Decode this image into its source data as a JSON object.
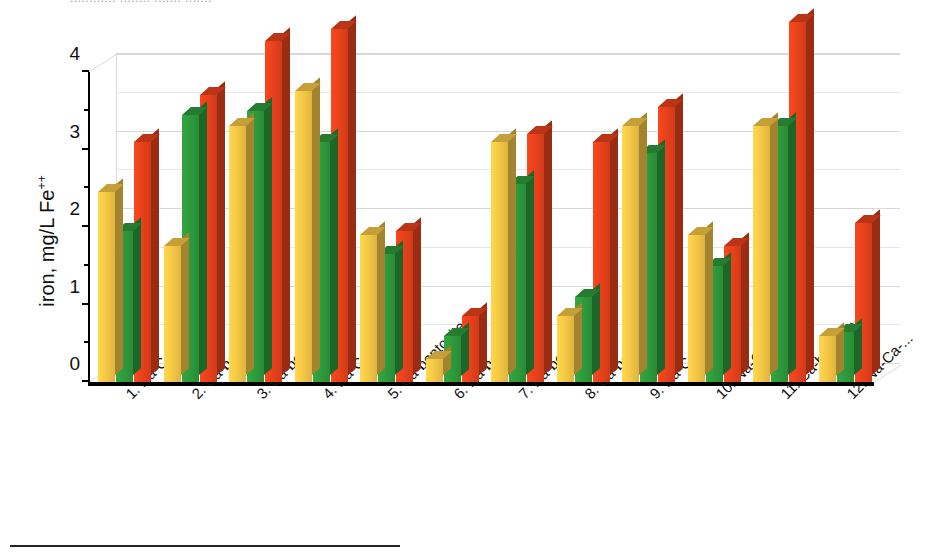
{
  "page": {
    "top_cut_text": "............ ........ ....... ......."
  },
  "axis": {
    "y_title": "iron, mg/L Fe",
    "y_title_sup": "++",
    "y_ticks": [
      "0",
      "1",
      "2",
      "3",
      "4"
    ]
  },
  "chart_data": {
    "type": "bar",
    "title": "",
    "subtitle": "",
    "xlabel": "",
    "ylabel": "iron, mg/L Fe++",
    "ylim": [
      0,
      4
    ],
    "ytick_values": [
      0,
      1,
      2,
      3,
      4
    ],
    "grid": true,
    "legend": "none",
    "three_d": true,
    "categories": [
      "1. Na-Ca-bentonite",
      "2. Ca-bentonite",
      "3. Ca-bentonite",
      "4. Na-Ca-bentonite",
      "5. Ca-bentonite",
      "6. Na-bentonite",
      "7. Na-bentonite",
      "8. Ca-bentonite",
      "9. Na-Ca-bentonite",
      "10. Na-Ca-...",
      "11. Ca-bentonite",
      "12. Na-Ca-..."
    ],
    "series": [
      {
        "name": "series-1",
        "color": "#F6C846",
        "values": [
          2.45,
          1.75,
          3.3,
          3.75,
          1.9,
          0.3,
          3.1,
          0.85,
          3.3,
          1.9,
          3.3,
          0.6
        ]
      },
      {
        "name": "series-2",
        "color": "#2E9B3C",
        "values": [
          1.95,
          3.45,
          3.5,
          3.1,
          1.65,
          0.6,
          2.55,
          1.1,
          2.95,
          1.5,
          3.3,
          0.65
        ]
      },
      {
        "name": "series-3",
        "color": "#E8421C",
        "values": [
          3.1,
          3.7,
          4.4,
          4.55,
          1.95,
          0.85,
          3.2,
          3.1,
          3.55,
          1.75,
          4.65,
          2.05
        ]
      }
    ]
  }
}
